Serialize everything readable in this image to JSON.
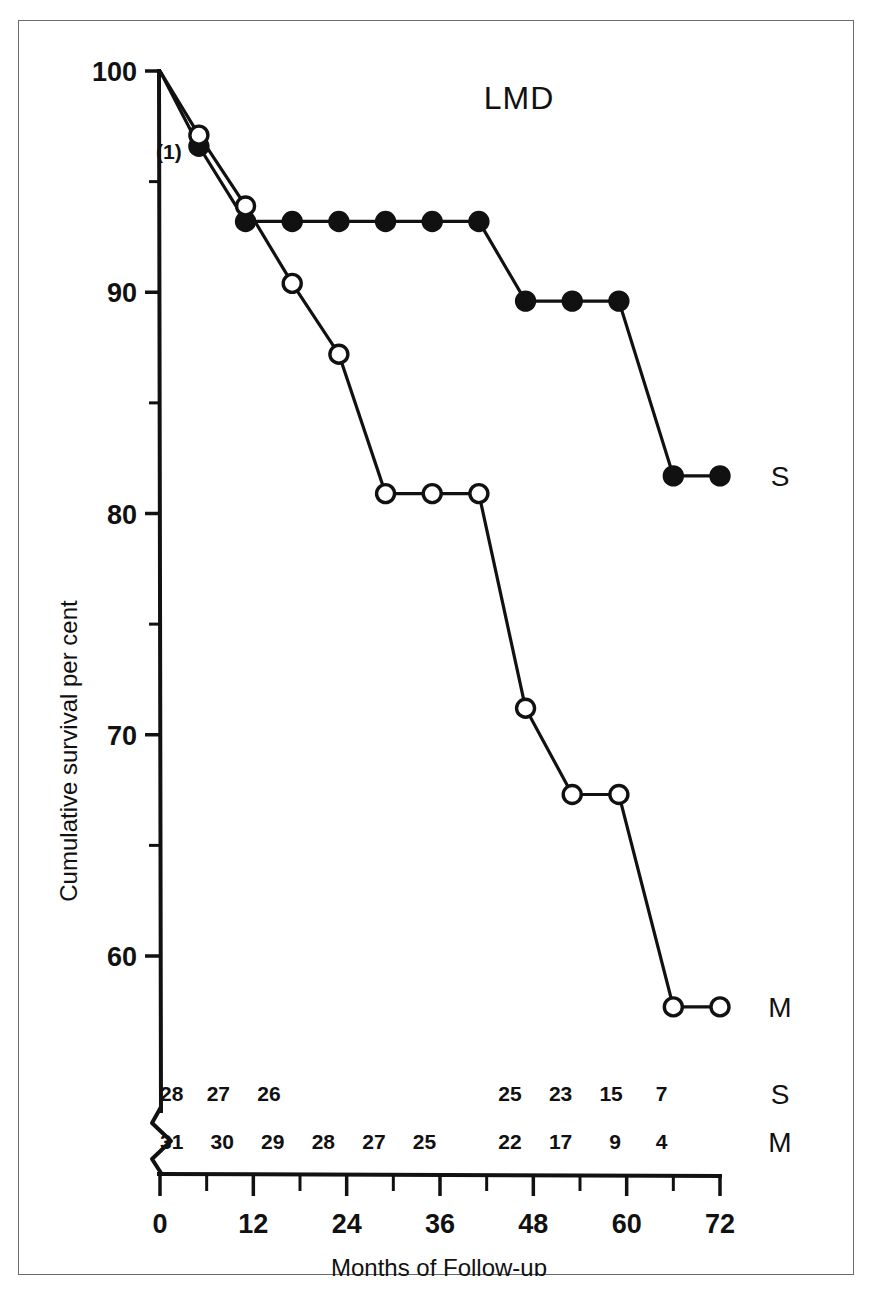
{
  "chart_data": {
    "type": "line",
    "title": "LMD",
    "xlabel": "Months of Follow-up",
    "ylabel": "Cumulative survival per cent",
    "xlim": [
      0,
      72
    ],
    "ylim": [
      55,
      100
    ],
    "grid": false,
    "legend_position": "right-of-curve-end",
    "x_ticks_major": [
      0,
      12,
      24,
      36,
      48,
      60,
      72
    ],
    "x_ticks_minor": [
      6,
      18,
      30,
      42,
      54,
      66
    ],
    "y_ticks_major": [
      60,
      70,
      80,
      90,
      100
    ],
    "y_ticks_minor": [
      65,
      75,
      85,
      95
    ],
    "annotation": "(1)",
    "series": [
      {
        "name": "S",
        "label": "S",
        "marker": "filled-circle",
        "points": [
          {
            "x": 0,
            "y": 100
          },
          {
            "x": 5,
            "y": 96.6
          },
          {
            "x": 11,
            "y": 93.2
          },
          {
            "x": 17,
            "y": 93.2
          },
          {
            "x": 23,
            "y": 93.2
          },
          {
            "x": 29,
            "y": 93.2
          },
          {
            "x": 35,
            "y": 93.2
          },
          {
            "x": 41,
            "y": 93.2
          },
          {
            "x": 47,
            "y": 89.6
          },
          {
            "x": 53,
            "y": 89.6
          },
          {
            "x": 59,
            "y": 89.6
          },
          {
            "x": 66,
            "y": 81.7
          },
          {
            "x": 72,
            "y": 81.7
          }
        ]
      },
      {
        "name": "M",
        "label": "M",
        "marker": "open-circle",
        "points": [
          {
            "x": 0,
            "y": 100
          },
          {
            "x": 5,
            "y": 97.1
          },
          {
            "x": 11,
            "y": 93.9
          },
          {
            "x": 17,
            "y": 90.4
          },
          {
            "x": 23,
            "y": 87.2
          },
          {
            "x": 29,
            "y": 80.9
          },
          {
            "x": 35,
            "y": 80.9
          },
          {
            "x": 41,
            "y": 80.9
          },
          {
            "x": 47,
            "y": 71.2
          },
          {
            "x": 53,
            "y": 67.3
          },
          {
            "x": 59,
            "y": 67.3
          },
          {
            "x": 66,
            "y": 57.7
          },
          {
            "x": 72,
            "y": 57.7
          }
        ]
      }
    ],
    "at_risk": {
      "rows": [
        {
          "label": "S",
          "counts": [
            {
              "x": 1.5,
              "value": "28"
            },
            {
              "x": 7.5,
              "value": "27"
            },
            {
              "x": 14.0,
              "value": "26"
            },
            {
              "x": 45.0,
              "value": "25"
            },
            {
              "x": 51.5,
              "value": "23"
            },
            {
              "x": 58.0,
              "value": "15"
            },
            {
              "x": 64.5,
              "value": "7"
            }
          ]
        },
        {
          "label": "M",
          "counts": [
            {
              "x": 1.5,
              "value": "31"
            },
            {
              "x": 8.0,
              "value": "30"
            },
            {
              "x": 14.5,
              "value": "29"
            },
            {
              "x": 21.0,
              "value": "28"
            },
            {
              "x": 27.5,
              "value": "27"
            },
            {
              "x": 34.0,
              "value": "25"
            },
            {
              "x": 45.0,
              "value": "22"
            },
            {
              "x": 51.5,
              "value": "17"
            },
            {
              "x": 58.5,
              "value": "9"
            },
            {
              "x": 64.5,
              "value": "4"
            }
          ]
        }
      ]
    },
    "colors": {
      "ink": "#111111",
      "frame": "#6b6b6b",
      "background": "#ffffff"
    }
  }
}
